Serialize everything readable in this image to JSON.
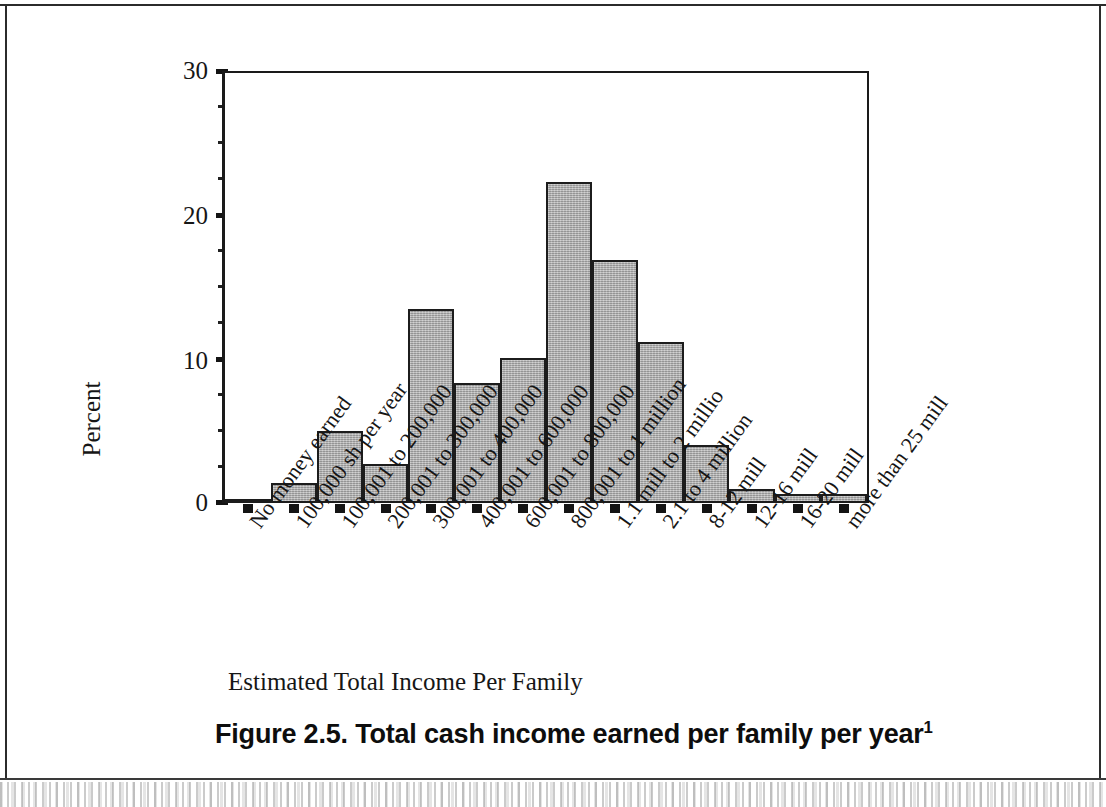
{
  "figure": {
    "caption_text": "Figure 2.5. Total cash income earned per family per year",
    "caption_footnote_marker": "1",
    "x_axis_title": "Estimated Total Income Per Family",
    "y_axis_title": "Percent"
  },
  "colors": {
    "bar_fill": "#a6a6a6",
    "bar_stroke": "#1c1c1c",
    "axis": "#141414",
    "text": "#161616",
    "page_background": "#ffffff"
  },
  "chart_data": {
    "type": "bar",
    "title": "Figure 2.5. Total cash income earned per family per year",
    "xlabel": "Estimated Total Income Per Family",
    "ylabel": "Percent",
    "ylim": [
      0,
      30
    ],
    "yticks": [
      0,
      10,
      20,
      30
    ],
    "ytick_labels": [
      "0",
      "10",
      "20",
      "30"
    ],
    "y_minor_ticks": [
      2.5,
      5,
      7.5,
      12.5,
      15,
      17.5,
      22.5,
      25,
      27.5
    ],
    "grid": false,
    "legend": null,
    "categories": [
      "No money earned",
      "100,000 sh per year",
      "100,001 to 200,000",
      "200,001 to 300,000",
      "300,001 to 400,000",
      "400,001 to 600,000",
      "600,001 to 800,000",
      "800,001 to 1 million",
      "1.1 mill to 2 millio",
      "2.1 to 4 million",
      "8-12 mill",
      "12-16 mill",
      "16-20 mill",
      "more than 25 mill"
    ],
    "values": [
      0.3,
      1.4,
      5.0,
      2.7,
      13.5,
      8.3,
      10.1,
      22.3,
      16.9,
      11.2,
      4.0,
      1.0,
      0.6,
      0.6
    ],
    "value_unit": "percent"
  }
}
